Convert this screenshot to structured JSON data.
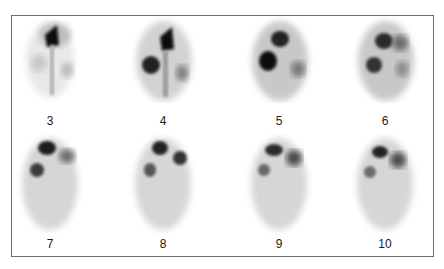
{
  "figure": {
    "type": "sequential scintigraphy frames",
    "frames": [
      {
        "label": "3",
        "row": 0,
        "col": 0
      },
      {
        "label": "4",
        "row": 0,
        "col": 1
      },
      {
        "label": "5",
        "row": 0,
        "col": 2
      },
      {
        "label": "6",
        "row": 0,
        "col": 3
      },
      {
        "label": "7",
        "row": 1,
        "col": 0
      },
      {
        "label": "8",
        "row": 1,
        "col": 1
      },
      {
        "label": "9",
        "row": 1,
        "col": 2
      },
      {
        "label": "10",
        "row": 1,
        "col": 3
      }
    ]
  },
  "colors": {
    "border": "#6e6e6e",
    "uptake_dark": "#111111",
    "background": "#ffffff"
  }
}
